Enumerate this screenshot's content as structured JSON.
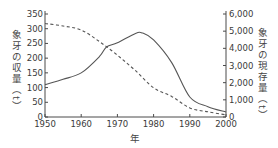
{
  "chart_data": {
    "type": "line",
    "title": "",
    "xlabel": "年",
    "ylabel_left": "象牙の収量（t）",
    "ylabel_right": "象牙の現存量（t）",
    "xlim": [
      1950,
      2000
    ],
    "ylim_left": [
      0,
      350
    ],
    "ylim_right": [
      0,
      6000
    ],
    "x_ticks": [
      "1950",
      "1960",
      "1970",
      "1980",
      "1990",
      "2000"
    ],
    "y_ticks_left": [
      "0",
      "50",
      "100",
      "150",
      "200",
      "250",
      "300",
      "350"
    ],
    "y_ticks_right": [
      "0",
      "1,000",
      "2,000",
      "3,000",
      "4,000",
      "5,000",
      "6,000"
    ],
    "grid": false,
    "legend": "none",
    "series": [
      {
        "name": "象牙の収量",
        "style": "solid",
        "axis": "left",
        "x": [
          1950,
          1955,
          1960,
          1965,
          1967,
          1970,
          1975,
          1977,
          1980,
          1985,
          1990,
          1995,
          2000
        ],
        "values": [
          110,
          128,
          150,
          205,
          238,
          252,
          284,
          285,
          262,
          185,
          68,
          35,
          17
        ]
      },
      {
        "name": "象牙の現存量",
        "style": "dashed",
        "axis": "right",
        "x": [
          1950,
          1955,
          1960,
          1965,
          1970,
          1975,
          1980,
          1985,
          1990,
          1995,
          2000
        ],
        "values": [
          5450,
          5300,
          5070,
          4400,
          3600,
          2700,
          1700,
          1200,
          530,
          300,
          120
        ]
      }
    ]
  },
  "labels": {
    "left_title": "象牙の収量（t）",
    "right_title": "象牙の現存量（t）",
    "x_title": "年"
  }
}
